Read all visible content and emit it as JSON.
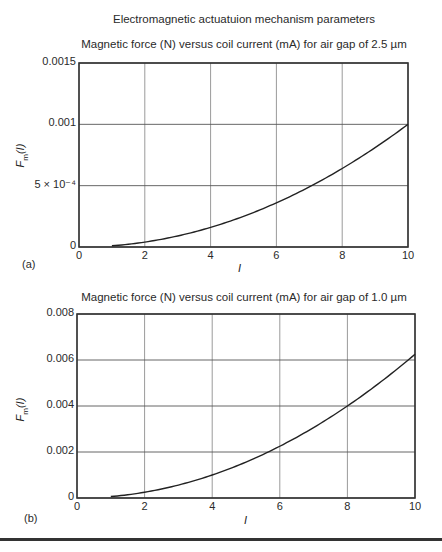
{
  "figure": {
    "main_title": "Electromagnetic actuatuion mechanism parameters"
  },
  "chart_data": [
    {
      "type": "line",
      "panel_label": "(a)",
      "title": "Magnetic force (N) versus coil current (mA) for air gap of 2.5 µm",
      "xlabel": "I",
      "ylabel": "Fm(I)",
      "xlim": [
        0,
        10
      ],
      "ylim": [
        0,
        0.0015
      ],
      "x_ticks": [
        "0",
        "2",
        "4",
        "6",
        "8",
        "10"
      ],
      "y_ticks": [
        "0",
        "5 × 10⁻⁴",
        "0.001",
        "0.0015"
      ],
      "y_tick_values": [
        0,
        0.0005,
        0.001,
        0.0015
      ],
      "grid": true,
      "series": [
        {
          "name": "Fm(I), gap 2.5 µm",
          "x": [
            1,
            2,
            3,
            4,
            5,
            6,
            7,
            8,
            9,
            10
          ],
          "y": [
            1e-05,
            4e-05,
            9e-05,
            0.00016,
            0.00025,
            0.00036,
            0.00049,
            0.00064,
            0.00081,
            0.001
          ]
        }
      ]
    },
    {
      "type": "line",
      "panel_label": "(b)",
      "title": "Magnetic force (N) versus coil current (mA) for air gap of 1.0 µm",
      "xlabel": "I",
      "ylabel": "Fm(I)",
      "xlim": [
        0,
        10
      ],
      "ylim": [
        0,
        0.008
      ],
      "x_ticks": [
        "0",
        "2",
        "4",
        "6",
        "8",
        "10"
      ],
      "y_ticks": [
        "0",
        "0.002",
        "0.004",
        "0.006",
        "0.008"
      ],
      "y_tick_values": [
        0,
        0.002,
        0.004,
        0.006,
        0.008
      ],
      "grid": true,
      "series": [
        {
          "name": "Fm(I), gap 1.0 µm",
          "x": [
            1,
            2,
            3,
            4,
            5,
            6,
            7,
            8,
            9,
            10
          ],
          "y": [
            6.25e-05,
            0.00025,
            0.0005625,
            0.001,
            0.0015625,
            0.00225,
            0.0030625,
            0.004,
            0.0050625,
            0.00625
          ]
        }
      ]
    }
  ]
}
